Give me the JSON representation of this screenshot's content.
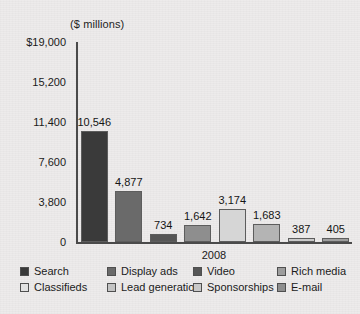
{
  "chart_data": {
    "type": "bar",
    "title": "($ millions)",
    "xlabel": "2008",
    "ylabel": "",
    "categories": [
      "Search",
      "Display ads",
      "Classifieds",
      "Lead generation",
      "Video",
      "Sponsorships",
      "Rich media",
      "E-mail"
    ],
    "values": [
      10546,
      4877,
      734,
      1642,
      3174,
      1683,
      387,
      405
    ],
    "value_labels": [
      "10,546",
      "4,877",
      "734",
      "1,642",
      "3,174",
      "1,683",
      "387",
      "405"
    ],
    "ylim": [
      0,
      19000
    ],
    "yticks": [
      19000,
      15200,
      11400,
      7600,
      3800,
      0
    ],
    "ytick_labels": [
      "$19,000",
      "15,200",
      "11,400",
      "7,600",
      "3,800",
      "0"
    ],
    "grid": false,
    "legend_position": "bottom",
    "colors": [
      "#3a3a3a",
      "#6a6a6a",
      "#565656",
      "#8e8e8e",
      "#d6d6d6",
      "#b4b4b4",
      "#c9c9c9",
      "#9d9d9d"
    ]
  },
  "legend": {
    "entries": [
      {
        "label": "Search",
        "color": "#3a3a3a"
      },
      {
        "label": "Display ads",
        "color": "#6a6a6a"
      },
      {
        "label": "Video",
        "color": "#565656"
      },
      {
        "label": "Rich media",
        "color": "#9d9d9d"
      },
      {
        "label": "Classifieds",
        "color": "#e2e2e2"
      },
      {
        "label": "Lead generation",
        "color": "#c4c4c4"
      },
      {
        "label": "Sponsorships",
        "color": "#c9c9c9"
      },
      {
        "label": "E-mail",
        "color": "#8e8e8e"
      }
    ]
  }
}
